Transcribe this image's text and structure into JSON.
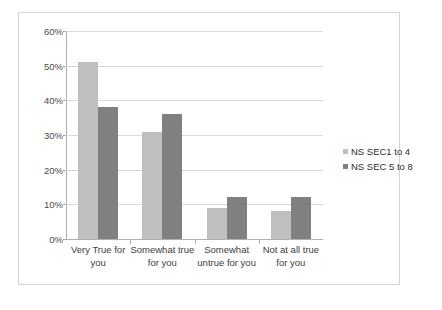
{
  "chart_data": {
    "type": "bar",
    "title": "",
    "subtitle": "",
    "xlabel": "",
    "ylabel": "",
    "ylim": [
      0,
      60
    ],
    "y_tick_step": 10,
    "y_tick_labels": [
      "0%",
      "10%",
      "20%",
      "30%",
      "40%",
      "50%",
      "60%"
    ],
    "y_tick_values": [
      0,
      10,
      20,
      30,
      40,
      50,
      60
    ],
    "grid": "horizontal",
    "legend_position": "right",
    "categories": [
      "Very True for you",
      "Somewhat true for you",
      "Somewhat untrue for you",
      "Not at all true for you"
    ],
    "series": [
      {
        "name": "NS SEC1 to 4",
        "color": "#BFBFBF",
        "values": [
          51,
          31,
          9,
          8
        ]
      },
      {
        "name": "NS SEC 5 to 8",
        "color": "#808080",
        "values": [
          38,
          36,
          12,
          12
        ]
      }
    ]
  }
}
